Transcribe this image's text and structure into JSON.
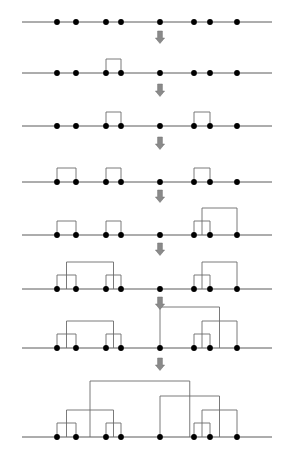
{
  "figure": {
    "title": "",
    "width": 291,
    "height": 460,
    "background_color": "#ffffff",
    "axis_color": "#5a5a5a",
    "dot_color": "#000000",
    "link_color": "#6b6b6b",
    "arrow_color": "#8a8a8a",
    "arrow_glyph": "downwards-double-arrow"
  },
  "chart_data": {
    "type": "diagram",
    "subtype": "agglomerative-hierarchical-clustering-progression",
    "title": "",
    "xlabel": "",
    "ylabel": "",
    "grid": false,
    "legend": "none",
    "leaf_count": 8,
    "leaf_labels": [
      "1",
      "2",
      "3",
      "4",
      "5",
      "6",
      "7",
      "8"
    ],
    "leaf_x": [
      57,
      76,
      106,
      121,
      160,
      194,
      210,
      237
    ],
    "axis_x_start": 22,
    "axis_x_end": 272,
    "panel_count": 8,
    "panel_baselines": [
      22,
      73,
      126,
      182,
      235,
      289,
      348,
      437
    ],
    "arrow_x": 160,
    "arrow_positions_y": [
      31,
      84,
      137,
      190,
      243,
      297,
      358
    ],
    "panels": [
      {
        "step": 0,
        "baseline_y": 22,
        "caption": "",
        "merges": []
      },
      {
        "step": 1,
        "baseline_y": 73,
        "caption": "",
        "merges": [
          {
            "left": 2,
            "right": 3,
            "height": 14
          }
        ]
      },
      {
        "step": 2,
        "baseline_y": 126,
        "caption": "",
        "merges": [
          {
            "left": 2,
            "right": 3,
            "height": 14
          },
          {
            "left": 5,
            "right": 6,
            "height": 14
          }
        ]
      },
      {
        "step": 3,
        "baseline_y": 182,
        "caption": "",
        "merges": [
          {
            "left": 0,
            "right": 1,
            "height": 14
          },
          {
            "left": 2,
            "right": 3,
            "height": 14
          },
          {
            "left": 5,
            "right": 6,
            "height": 14
          }
        ]
      },
      {
        "step": 4,
        "baseline_y": 235,
        "caption": "",
        "merges": [
          {
            "left": 0,
            "right": 1,
            "height": 14
          },
          {
            "left": 2,
            "right": 3,
            "height": 14
          },
          {
            "left": 5,
            "right": 6,
            "height": 14
          },
          {
            "left": "m2",
            "right": 7,
            "height": 27
          }
        ]
      },
      {
        "step": 5,
        "baseline_y": 289,
        "caption": "",
        "merges": [
          {
            "left": 0,
            "right": 1,
            "height": 14
          },
          {
            "left": 2,
            "right": 3,
            "height": 14
          },
          {
            "left": 5,
            "right": 6,
            "height": 14
          },
          {
            "left": "m2",
            "right": 7,
            "height": 27
          },
          {
            "left": "m0",
            "right": "m1",
            "height": 27
          }
        ]
      },
      {
        "step": 6,
        "baseline_y": 348,
        "caption": "",
        "merges": [
          {
            "left": 0,
            "right": 1,
            "height": 14
          },
          {
            "left": 2,
            "right": 3,
            "height": 14
          },
          {
            "left": 5,
            "right": 6,
            "height": 14
          },
          {
            "left": "m2",
            "right": 7,
            "height": 27
          },
          {
            "left": "m0",
            "right": "m1",
            "height": 27
          },
          {
            "left": 4,
            "right": "m3",
            "height": 41
          }
        ]
      },
      {
        "step": 7,
        "baseline_y": 437,
        "caption": "",
        "merges": [
          {
            "left": 0,
            "right": 1,
            "height": 14
          },
          {
            "left": 2,
            "right": 3,
            "height": 14
          },
          {
            "left": 5,
            "right": 6,
            "height": 14
          },
          {
            "left": "m2",
            "right": 7,
            "height": 27
          },
          {
            "left": "m0",
            "right": "m1",
            "height": 27
          },
          {
            "left": 4,
            "right": "m3",
            "height": 41
          },
          {
            "left": "m4",
            "right": "m5",
            "height": 56
          }
        ]
      }
    ]
  }
}
